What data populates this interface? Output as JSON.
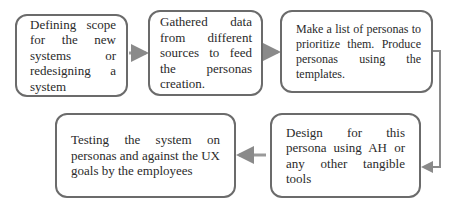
{
  "diagram": {
    "type": "process-flow",
    "steps": [
      {
        "id": 1,
        "text": "Defining scope for the new systems or redesigning a system"
      },
      {
        "id": 2,
        "text": "Gathered data from different sources to feed the personas creation."
      },
      {
        "id": 3,
        "text": "Make a list of personas to prioritize them. Produce personas using the templates."
      },
      {
        "id": 4,
        "text": "Design for this persona using AH or any other tangible tools"
      },
      {
        "id": 5,
        "text": "Testing the system on personas and against the UX goals by the employees"
      }
    ],
    "edges": [
      {
        "from": 1,
        "to": 2
      },
      {
        "from": 2,
        "to": 3
      },
      {
        "from": 3,
        "to": 4
      },
      {
        "from": 4,
        "to": 5
      }
    ],
    "colors": {
      "border": "#6b6b6b",
      "arrow": "#8a8a8a",
      "text": "#2a2a2a"
    }
  }
}
